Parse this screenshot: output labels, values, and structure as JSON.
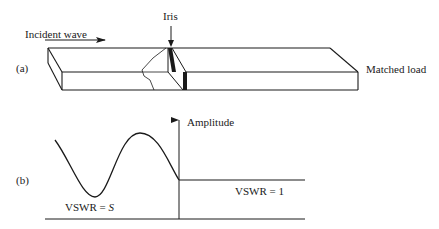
{
  "figure": {
    "part_a": {
      "label": "(a)",
      "incident_wave_label": "Incident wave",
      "iris_label": "Iris",
      "load_label": "Matched load"
    },
    "part_b": {
      "label": "(b)",
      "axis_label": "Amplitude",
      "left_region_label_prefix": "VSWR = ",
      "left_region_label_var": "S",
      "right_region_label": "VSWR = 1"
    },
    "colors": {
      "ink": "#1a1a1a",
      "background": "#ffffff"
    }
  }
}
